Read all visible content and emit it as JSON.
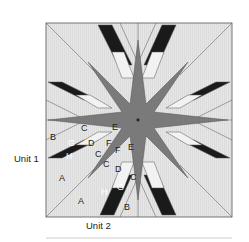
{
  "diagram": {
    "type": "quilt-block",
    "unit_labels": [
      {
        "text": "Unit 1",
        "side": "left"
      },
      {
        "text": "Unit 2",
        "side": "bottom"
      }
    ],
    "piece_labels": {
      "unit1": [
        "B",
        "C",
        "E",
        "G",
        "D",
        "F",
        "H",
        "C",
        "A"
      ],
      "unit2": [
        "E",
        "F",
        "C",
        "C",
        "D",
        "C",
        "G",
        "H",
        "A",
        "B"
      ]
    },
    "colors": {
      "background": "#e8e8e8",
      "dark": "#1a1a1a",
      "medium": "#7a7a7a",
      "light": "#f2f2f2",
      "outline": "#444444",
      "rule": "#cccccc"
    }
  }
}
